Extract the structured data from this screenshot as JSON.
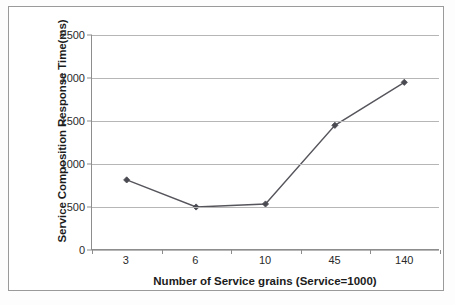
{
  "chart_data": {
    "type": "line",
    "title": "",
    "xlabel": "Number of Service grains (Service=1000)",
    "ylabel": "Service Composition Response Time(ms)",
    "categories": [
      "3",
      "6",
      "10",
      "45",
      "140"
    ],
    "values": [
      815,
      500,
      535,
      1450,
      1950
    ],
    "series": [
      {
        "name": "Service Composition Response Time",
        "values": [
          815,
          500,
          535,
          1450,
          1950
        ]
      }
    ],
    "ylim": [
      0,
      2500
    ],
    "y_ticks": [
      "0",
      "500",
      "1000",
      "1500",
      "2000",
      "2500"
    ],
    "y_tick_values": [
      0,
      500,
      1000,
      1500,
      2000,
      2500
    ],
    "x_tick_labels": [
      "3",
      "6",
      "10",
      "45",
      "140"
    ],
    "grid": true,
    "legend": false,
    "legend_position": "none",
    "marker": "diamond",
    "line_color": "#55555c",
    "marker_color": "#4a4a52",
    "grid_color": "#b6b6b6",
    "axis_color": "#8d8d8d",
    "background_color": "#ffffff"
  },
  "frame": {
    "border_color": "#9a9a9a"
  }
}
